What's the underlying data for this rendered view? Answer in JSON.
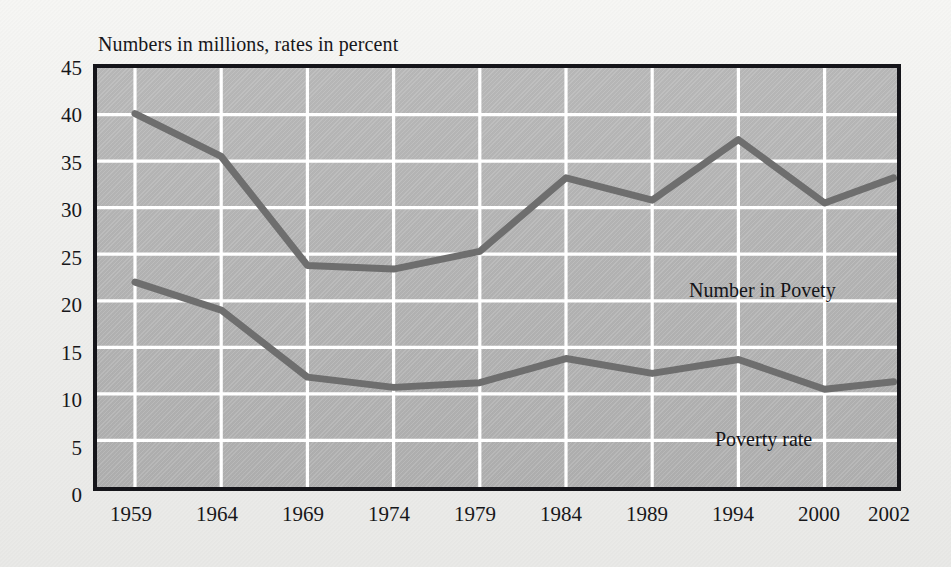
{
  "chart_data": {
    "type": "line",
    "title": "Numbers in millions, rates in percent",
    "xlabel": "",
    "ylabel": "",
    "x": [
      "1959",
      "1964",
      "1969",
      "1974",
      "1979",
      "1984",
      "1989",
      "1994",
      "2000",
      "2002"
    ],
    "xlim": [
      0,
      9
    ],
    "ylim": [
      0,
      45
    ],
    "ytick_labels": [
      "0",
      "5",
      "10",
      "15",
      "20",
      "25",
      "30",
      "35",
      "40",
      "45"
    ],
    "ytick_values": [
      0,
      5,
      10,
      15,
      20,
      25,
      30,
      35,
      40,
      45
    ],
    "xtick_labels": [
      "1959",
      "1964",
      "1969",
      "1974",
      "1979",
      "1984",
      "1989",
      "1994",
      "2000",
      "2002"
    ],
    "grid": true,
    "legend_position": "inline-annotations",
    "series": [
      {
        "name": "Number in Povety",
        "label": "Number in Povety",
        "color": "#6e6e6e",
        "values": [
          40.1,
          35.5,
          23.8,
          23.4,
          25.3,
          33.2,
          30.8,
          37.3,
          30.5,
          33.2
        ]
      },
      {
        "name": "Poverty rate",
        "label": "Poverty rate",
        "color": "#6e6e6e",
        "values": [
          22.0,
          19.0,
          11.8,
          10.7,
          11.2,
          13.8,
          12.2,
          13.7,
          10.5,
          11.3
        ]
      }
    ],
    "annotations": [
      {
        "text": "Number in Povety",
        "x": 5.6,
        "y": 28.5
      },
      {
        "text": "Poverty rate",
        "x": 6.0,
        "y": 12.0
      }
    ],
    "colors": {
      "line": "#6e6e6e",
      "plot_background": "#b4b4b4",
      "grid": "#ffffff",
      "frame": "#15151a",
      "page_background": "#f2f2f0",
      "text": "#17171a"
    }
  }
}
